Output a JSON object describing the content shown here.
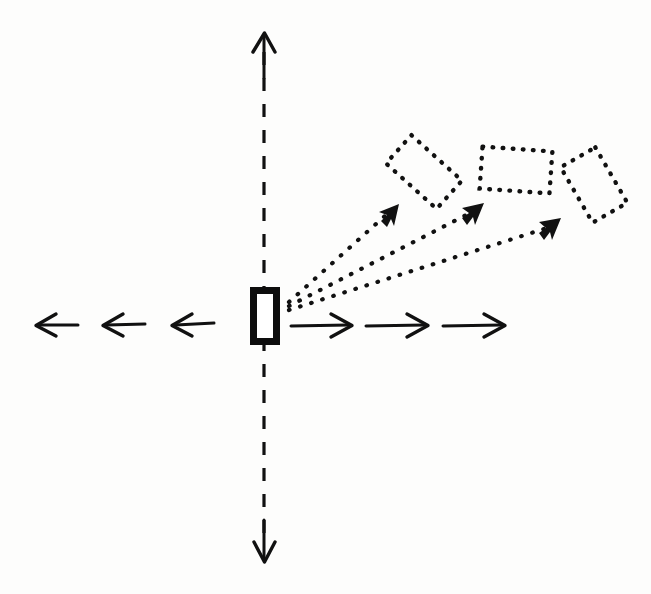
{
  "figure": {
    "name": "projectile-launch-diagram",
    "title": "",
    "background_color": "#fdfdfc",
    "ink_color": "#111111",
    "width": 651,
    "height": 594,
    "style": "hand-drawn-sketch"
  },
  "origin": {
    "name": "origin",
    "x": 265,
    "y": 325
  },
  "vertical_axis": {
    "name": "vertical-axis",
    "style": "dashed",
    "x": 264,
    "y_top": 33,
    "y_bottom": 562,
    "arrow_up": true,
    "arrow_down": true,
    "label": ""
  },
  "horizontal_axis": {
    "name": "horizontal-axis",
    "style": "segmented-arrows",
    "y": 325,
    "x_left": 36,
    "x_right": 505,
    "label": ""
  },
  "left_arrows": [
    {
      "name": "left-arrow-1",
      "x_tail": 145,
      "x_tip": 103,
      "y": 325
    },
    {
      "name": "left-arrow-2",
      "x_tail": 213,
      "x_tip": 172,
      "y": 325
    },
    {
      "name": "left-arrow-3",
      "x_tail": 78,
      "x_tip": 36,
      "y": 325
    }
  ],
  "right_arrows": [
    {
      "name": "right-arrow-1",
      "x_tail": 291,
      "x_tip": 352,
      "y": 325
    },
    {
      "name": "right-arrow-2",
      "x_tail": 366,
      "x_tip": 428,
      "y": 325
    },
    {
      "name": "right-arrow-3",
      "x_tail": 443,
      "x_tip": 505,
      "y": 325
    }
  ],
  "launcher": {
    "name": "launcher-block",
    "shape": "filled-outline-rectangle",
    "x": 250,
    "y": 287,
    "width": 30,
    "height": 58,
    "fill": "#ffffff",
    "stroke": "#0d0d0d",
    "stroke_width": 7
  },
  "trajectories": [
    {
      "name": "trajectory-1",
      "style": "dotted",
      "from_x": 289,
      "from_y": 302,
      "to_x": 398,
      "to_y": 205,
      "arrowhead": true,
      "angle_deg": 42
    },
    {
      "name": "trajectory-2",
      "style": "dotted",
      "from_x": 289,
      "from_y": 305,
      "to_x": 483,
      "to_y": 203,
      "arrowhead": true,
      "angle_deg": 28
    },
    {
      "name": "trajectory-3",
      "style": "dotted",
      "from_x": 289,
      "from_y": 309,
      "to_x": 560,
      "to_y": 218,
      "arrowhead": true,
      "angle_deg": 19
    }
  ],
  "projectiles": [
    {
      "name": "projectile-1",
      "style": "dotted-rectangle",
      "cx": 424,
      "cy": 172,
      "width": 68,
      "height": 38,
      "rotation_deg": 42
    },
    {
      "name": "projectile-2",
      "style": "dotted-rectangle",
      "cx": 516,
      "cy": 170,
      "width": 70,
      "height": 42,
      "rotation_deg": 4
    },
    {
      "name": "projectile-3",
      "style": "dotted-rectangle",
      "cx": 594,
      "cy": 185,
      "width": 64,
      "height": 40,
      "rotation_deg": 60
    }
  ]
}
